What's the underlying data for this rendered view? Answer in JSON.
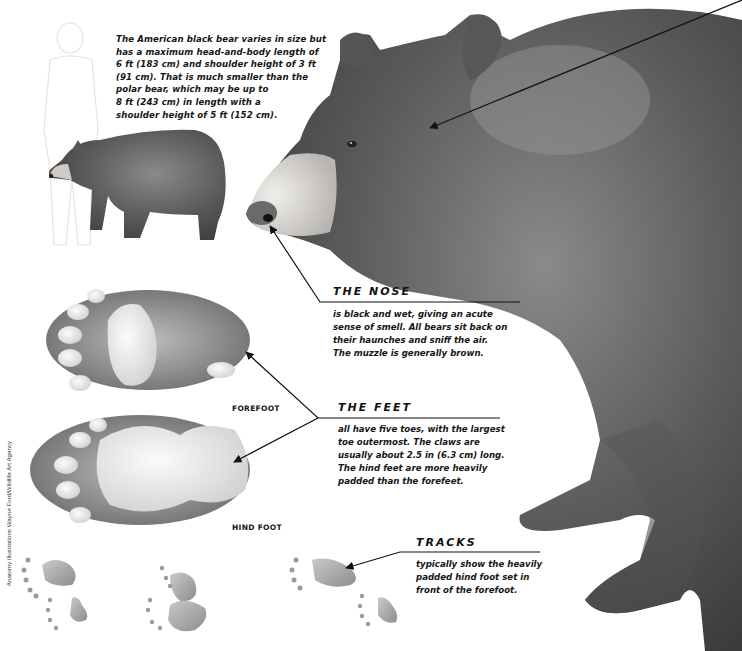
{
  "intro": {
    "lines": [
      "The American black bear varies in size but",
      "has a maximum head-and-body length of",
      "6 ft (183 cm) and shoulder height of 3 ft",
      "(91 cm). That is much smaller than the",
      "polar bear, which may be up to",
      "8 ft (243 cm) in length with a",
      "shoulder height of 5 ft (152 cm)."
    ]
  },
  "callouts": {
    "nose": {
      "heading": "THE NOSE",
      "lines": [
        "is black and wet, giving an acute",
        "sense of smell. All bears sit back on",
        "their haunches and sniff the air.",
        "The muzzle is generally brown."
      ]
    },
    "feet": {
      "heading": "THE FEET",
      "lines": [
        "all have five toes, with the largest",
        "toe outermost. The claws are",
        "usually about 2.5 in (6.3 cm) long.",
        "The hind feet are more heavily",
        "padded than the forefeet."
      ]
    },
    "tracks": {
      "heading": "TRACKS",
      "lines": [
        "typically show the heavily",
        "padded hind foot set in",
        "front of the forefoot."
      ]
    }
  },
  "labels": {
    "forefoot": "FOREFOOT",
    "hind_foot": "HIND FOOT"
  },
  "credit": "Anatomy illustrations Wayne Ford/Wildlife Art Agency",
  "illustrations": {
    "main": "black-bear-head-and-forequarters",
    "small_bear": "black-bear-full-body-scale",
    "human": "human-silhouette-scale",
    "paws": [
      "forefoot-sole",
      "hind-foot-sole"
    ],
    "tracks": "footprint-tracks"
  },
  "colors": {
    "fur_dark": "#3a3a3a",
    "fur_mid": "#6e6e6e",
    "muzzle": "#d8d4cf",
    "pad": "#e6e6e6",
    "line": "#111111"
  }
}
